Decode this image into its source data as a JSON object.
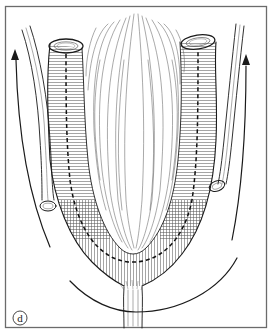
{
  "figure": {
    "panel_label": "d",
    "colors": {
      "ink": "#1a1a1a",
      "frame": "#6b6b6b",
      "background": "#ffffff"
    },
    "elements": {
      "left_arrow": "upward curved arrow (left side)",
      "right_arrow": "upward curved arrow (right side)",
      "bottom_arc": "curved line beneath the U-shaped tube",
      "u_tube": "U-shaped tubular structure with dashed midline",
      "left_vessel": "cut vessel segment (left)",
      "right_vessel": "cut vessel segment (right)",
      "central_tissue": "fan of fibrous tissue between the limbs",
      "stem": "short vertical stem at base of U"
    }
  }
}
